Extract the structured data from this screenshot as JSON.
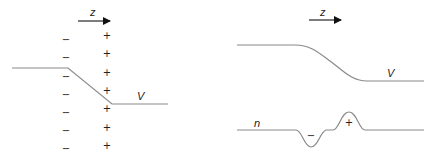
{
  "left_panel": {
    "axis_label": "z",
    "potential_label": "V",
    "negative_sign": "−",
    "positive_sign": "+",
    "negative_count": 7,
    "positive_count": 7
  },
  "right_panel": {
    "axis_label": "z",
    "potential_label": "V",
    "density_label": "n",
    "dip_sign": "−",
    "bump_sign": "+"
  },
  "colors": {
    "curve": "#8a8a8a",
    "text": "#222222",
    "arrow": "#111111"
  }
}
